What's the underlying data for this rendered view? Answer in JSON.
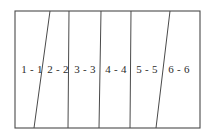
{
  "figure": {
    "background_color": "#ffffff",
    "stroke_color": "#4a4a4a",
    "label_color": "#2b2b2b",
    "frame": {
      "x": 15,
      "y": 11,
      "width": 185,
      "height": 117
    },
    "regions": [
      {
        "id": "region-1",
        "label": "1 - 1",
        "label_x": 32,
        "label_y": 70
      },
      {
        "id": "region-2",
        "label": "2 - 2",
        "label_x": 58,
        "label_y": 70
      },
      {
        "id": "region-3",
        "label": "3 - 3",
        "label_x": 85,
        "label_y": 70
      },
      {
        "id": "region-4",
        "label": "4 - 4",
        "label_x": 116,
        "label_y": 70
      },
      {
        "id": "region-5",
        "label": "5 - 5",
        "label_x": 147,
        "label_y": 70
      },
      {
        "id": "region-6",
        "label": "6 - 6",
        "label_x": 179,
        "label_y": 70
      }
    ],
    "dividers": [
      {
        "id": "divider-1",
        "x_top": 50,
        "x_bottom": 34,
        "slanted": true
      },
      {
        "id": "divider-2",
        "x_top": 69,
        "x_bottom": 68,
        "slanted": false
      },
      {
        "id": "divider-3",
        "x_top": 101,
        "x_bottom": 99,
        "slanted": false
      },
      {
        "id": "divider-4",
        "x_top": 131,
        "x_bottom": 130,
        "slanted": false
      },
      {
        "id": "divider-5",
        "x_top": 170,
        "x_bottom": 156,
        "slanted": true
      }
    ]
  }
}
